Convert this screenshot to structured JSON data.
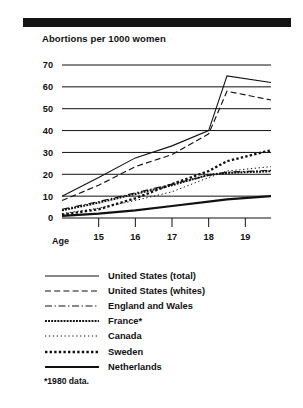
{
  "header": {
    "rule": "black-divider-bar"
  },
  "chart_data": {
    "type": "line",
    "title": "Abortions per 1000 women",
    "xlabel": "Age",
    "ylabel": "",
    "xlim": [
      14,
      19.7
    ],
    "ylim": [
      0,
      70
    ],
    "grid": true,
    "legend_position": "below",
    "x_ticks": [
      "15",
      "16",
      "17",
      "18",
      "19"
    ],
    "x_tick_values": [
      15,
      16,
      17,
      18,
      19
    ],
    "y_ticks": [
      "0",
      "10",
      "20",
      "30",
      "40",
      "50",
      "60",
      "70"
    ],
    "y_tick_values": [
      0,
      10,
      20,
      30,
      40,
      50,
      60,
      70
    ],
    "x": [
      14,
      15,
      16,
      17,
      18,
      18.5,
      19.7
    ],
    "series": [
      {
        "name": "United States (total)",
        "style": "solid",
        "values": [
          10,
          18.5,
          27.5,
          33,
          40,
          65,
          62
        ]
      },
      {
        "name": "United States (whites)",
        "style": "dashed",
        "values": [
          8,
          15,
          23.5,
          29,
          38.5,
          58,
          54
        ]
      },
      {
        "name": "England and Wales",
        "style": "dash-dot",
        "values": [
          4,
          7.5,
          11.5,
          15.5,
          19.5,
          21,
          21.8
        ]
      },
      {
        "name": "France*",
        "style": "dense-dash",
        "values": [
          3.5,
          7,
          11,
          15,
          19.8,
          20.6,
          21.4
        ]
      },
      {
        "name": "Canada",
        "style": "fine-dotted",
        "values": [
          2,
          4.5,
          8,
          12,
          18.5,
          21.5,
          23.5
        ]
      },
      {
        "name": "Sweden",
        "style": "bold-dotted",
        "values": [
          1.5,
          4,
          9,
          15.5,
          21.5,
          26,
          31
        ]
      },
      {
        "name": "Netherlands",
        "style": "thick-solid",
        "values": [
          1,
          2,
          3.5,
          5.5,
          7.5,
          8.5,
          10
        ]
      }
    ],
    "footnote": "*1980 data."
  },
  "legend": {
    "items": [
      {
        "label": "United States (total)",
        "style": "solid"
      },
      {
        "label": "United States (whites)",
        "style": "dashed"
      },
      {
        "label": "England and Wales",
        "style": "dash-dot"
      },
      {
        "label": "France*",
        "style": "dense-dash"
      },
      {
        "label": "Canada",
        "style": "fine-dotted"
      },
      {
        "label": "Sweden",
        "style": "bold-dotted"
      },
      {
        "label": "Netherlands",
        "style": "thick-solid"
      }
    ]
  },
  "colors": {
    "ink": "#111111",
    "rule": "#141414",
    "background": "#ffffff"
  }
}
